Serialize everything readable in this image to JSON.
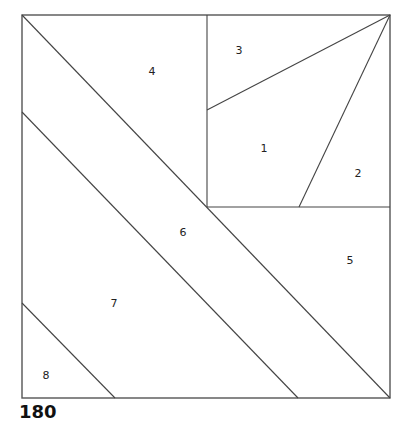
{
  "pattern_number": "180",
  "colors": {
    "line": "#444444",
    "outline": "#555555",
    "background": "#ffffff",
    "text": "#222222"
  },
  "square": {
    "x1": 22,
    "y1": 15,
    "x2": 390,
    "y2": 398
  },
  "lines": [
    {
      "name": "diagonal-upper",
      "x1": 22,
      "y1": 15,
      "x2": 390,
      "y2": 398
    },
    {
      "name": "diagonal-lower",
      "x1": 22,
      "y1": 112,
      "x2": 298,
      "y2": 398
    },
    {
      "name": "corner-cut",
      "x1": 22,
      "y1": 303,
      "x2": 115,
      "y2": 398
    },
    {
      "name": "vertical-divider",
      "x1": 207,
      "y1": 15,
      "x2": 207,
      "y2": 207
    },
    {
      "name": "horizontal-divider",
      "x1": 207,
      "y1": 207,
      "x2": 390,
      "y2": 207
    },
    {
      "name": "fan-line-3",
      "x1": 207,
      "y1": 110,
      "x2": 390,
      "y2": 15
    },
    {
      "name": "fan-line-2",
      "x1": 299,
      "y1": 207,
      "x2": 390,
      "y2": 15
    }
  ],
  "pieces": [
    {
      "label": "1",
      "x": 264,
      "y": 152
    },
    {
      "label": "2",
      "x": 358,
      "y": 177
    },
    {
      "label": "3",
      "x": 239,
      "y": 54
    },
    {
      "label": "4",
      "x": 152,
      "y": 75
    },
    {
      "label": "5",
      "x": 350,
      "y": 264
    },
    {
      "label": "6",
      "x": 183,
      "y": 236
    },
    {
      "label": "7",
      "x": 114,
      "y": 307
    },
    {
      "label": "8",
      "x": 46,
      "y": 379
    }
  ]
}
